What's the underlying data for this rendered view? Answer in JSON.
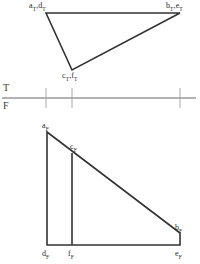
{
  "drawing": {
    "title": "Orthographic projection of plane ABC and line DEF",
    "background_color": "#ffffff",
    "object_line_color": "#333333",
    "fold_line_color": "#999999",
    "tick_color": "#a8a8a8",
    "label_color": "#2b2b2b",
    "object_line_width": 1.6,
    "fold_line_width": 1.4,
    "tick_line_width": 1.0
  },
  "fold_line": {
    "top_letter": "T",
    "bottom_letter": "F",
    "y": 98,
    "x_start": 2,
    "x_end": 196,
    "ticks": [
      46,
      72,
      180
    ]
  },
  "top_view": {
    "name": "top-view",
    "vertices": {
      "a_d": {
        "x": 46,
        "y": 13
      },
      "b_e": {
        "x": 180,
        "y": 13
      },
      "c_f": {
        "x": 72,
        "y": 70
      }
    },
    "labels": [
      {
        "id": "ad-top",
        "text": "a",
        "sub": "T",
        "text2": ",d",
        "sub2": "T",
        "x": 29,
        "y": 2
      },
      {
        "id": "be-top",
        "text": "b",
        "sub": "T",
        "text2": ",e",
        "sub2": "T",
        "x": 166,
        "y": 2
      },
      {
        "id": "cf-top",
        "text": "c",
        "sub": "T",
        "text2": ",f",
        "sub2": "T",
        "x": 62,
        "y": 72
      }
    ]
  },
  "front_view": {
    "name": "front-view",
    "vertices": {
      "a": {
        "x": 47,
        "y": 132
      },
      "c": {
        "x": 72,
        "y": 153
      },
      "b": {
        "x": 180,
        "y": 233
      },
      "d": {
        "x": 47,
        "y": 245
      },
      "f": {
        "x": 72,
        "y": 245
      },
      "e": {
        "x": 180,
        "y": 245
      }
    },
    "labels": [
      {
        "id": "a-front",
        "text": "a",
        "sub": "F",
        "x": 42,
        "y": 122
      },
      {
        "id": "c-front",
        "text": "c",
        "sub": "F",
        "x": 70,
        "y": 143
      },
      {
        "id": "b-front",
        "text": "b",
        "sub": "F",
        "x": 175,
        "y": 224
      },
      {
        "id": "d-front",
        "text": "d",
        "sub": "F",
        "x": 42,
        "y": 250
      },
      {
        "id": "f-front",
        "text": "f",
        "sub": "F",
        "x": 68,
        "y": 250
      },
      {
        "id": "e-front",
        "text": "e",
        "sub": "F",
        "x": 175,
        "y": 250
      }
    ]
  }
}
